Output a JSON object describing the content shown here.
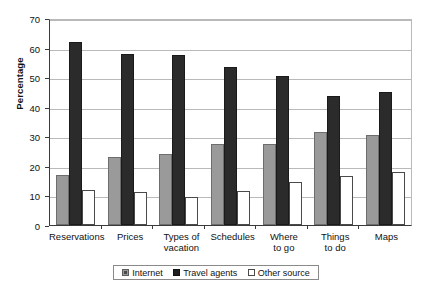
{
  "chart_data": {
    "type": "bar",
    "title": "",
    "xlabel": "",
    "ylabel": "Percentage",
    "ylim": [
      0,
      70
    ],
    "yticks": [
      0,
      10,
      20,
      30,
      40,
      50,
      60,
      70
    ],
    "grid": true,
    "legend_position": "bottom",
    "categories": [
      "Reservations",
      "Prices",
      "Types of\nvacation",
      "Schedules",
      "Where\nto go",
      "Things\nto do",
      "Maps"
    ],
    "series": [
      {
        "name": "Internet",
        "color": "#9a9a9a",
        "values": [
          17,
          23,
          24,
          27.5,
          27.5,
          31.5,
          30.5
        ]
      },
      {
        "name": "Travel agents",
        "color": "#2b2b2b",
        "values": [
          62,
          58,
          57.5,
          53.5,
          50.5,
          43.5,
          45
        ]
      },
      {
        "name": "Other source",
        "color": "#ffffff",
        "values": [
          12,
          11,
          9.5,
          11.5,
          14.5,
          16.5,
          18
        ]
      }
    ]
  },
  "legend": {
    "items": [
      {
        "label": "Internet"
      },
      {
        "label": "Travel agents"
      },
      {
        "label": "Other source"
      }
    ]
  },
  "axis": {
    "y_title": "Percentage"
  }
}
